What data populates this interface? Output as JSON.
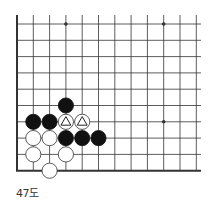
{
  "diagram": {
    "type": "go-board-fragment",
    "caption": "47도",
    "colors": {
      "line": "#333333",
      "black_stone": "#111111",
      "white_stone": "#ffffff",
      "stone_outline": "#333333",
      "marker": "#222222"
    },
    "board": {
      "visible_columns": 12,
      "visible_rows": 10,
      "edges": [
        "left",
        "bottom"
      ],
      "star_points": [
        {
          "col": 3,
          "row": 0
        },
        {
          "col": 9,
          "row": 0
        },
        {
          "col": 9,
          "row": 6
        }
      ]
    },
    "stones": [
      {
        "color": "black",
        "col": 3,
        "row": 5,
        "marker": null
      },
      {
        "color": "black",
        "col": 1,
        "row": 6,
        "marker": null
      },
      {
        "color": "black",
        "col": 2,
        "row": 6,
        "marker": null
      },
      {
        "color": "white",
        "col": 3,
        "row": 6,
        "marker": "triangle"
      },
      {
        "color": "white",
        "col": 4,
        "row": 6,
        "marker": "triangle"
      },
      {
        "color": "white",
        "col": 1,
        "row": 7,
        "marker": null
      },
      {
        "color": "white",
        "col": 2,
        "row": 7,
        "marker": null
      },
      {
        "color": "black",
        "col": 3,
        "row": 7,
        "marker": null
      },
      {
        "color": "black",
        "col": 4,
        "row": 7,
        "marker": null
      },
      {
        "color": "black",
        "col": 5,
        "row": 7,
        "marker": null
      },
      {
        "color": "white",
        "col": 1,
        "row": 8,
        "marker": null
      },
      {
        "color": "white",
        "col": 3,
        "row": 8,
        "marker": null
      },
      {
        "color": "white",
        "col": 2,
        "row": 9,
        "marker": null
      }
    ]
  }
}
